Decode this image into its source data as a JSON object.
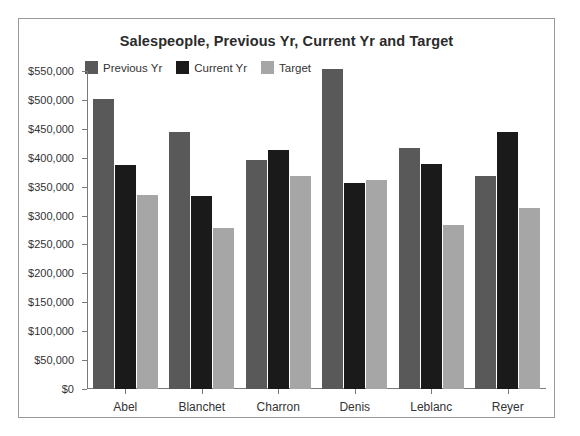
{
  "chart_data": {
    "type": "bar",
    "title": "Salespeople, Previous Yr, Current Yr and Target",
    "xlabel": "",
    "ylabel": "",
    "categories": [
      "Abel",
      "Blanchet",
      "Charron",
      "Denis",
      "Leblanc",
      "Reyer"
    ],
    "series": [
      {
        "name": "Previous Yr",
        "color": "#595959",
        "values": [
          501000,
          444000,
          396000,
          553000,
          417000,
          368000
        ]
      },
      {
        "name": "Current Yr",
        "color": "#1a1a1a",
        "values": [
          388000,
          334000,
          414000,
          356000,
          390000,
          444000
        ]
      },
      {
        "name": "Target",
        "color": "#a6a6a6",
        "values": [
          335000,
          278000,
          368000,
          361000,
          283000,
          313000
        ]
      }
    ],
    "ylim": [
      0,
      550000
    ],
    "ytick_values": [
      0,
      50000,
      100000,
      150000,
      200000,
      250000,
      300000,
      350000,
      400000,
      450000,
      500000,
      550000
    ],
    "ytick_labels": [
      "$0",
      "$50,000",
      "$100,000",
      "$150,000",
      "$200,000",
      "$250,000",
      "$300,000",
      "$350,000",
      "$400,000",
      "$450,000",
      "$500,000",
      "$550,000"
    ],
    "grid": false,
    "legend_position": "top-left",
    "axis_color": "#7a7a7a",
    "text_color": "#333333",
    "border_color": "#9a9a9a",
    "background": "#ffffff"
  }
}
